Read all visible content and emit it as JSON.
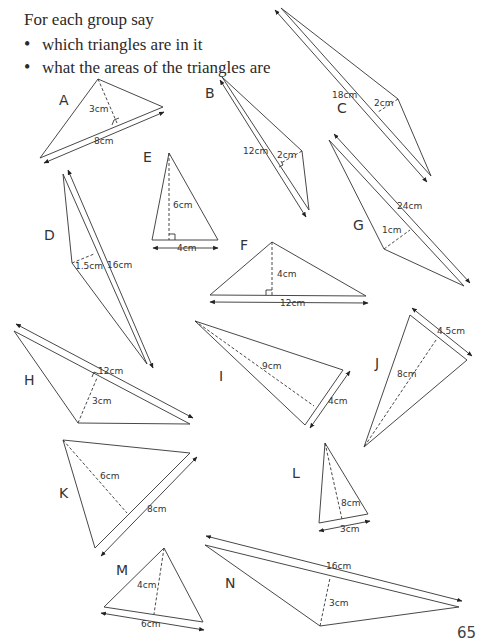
{
  "instructions": {
    "title": "For each group say",
    "bullets": [
      "which triangles are in it",
      "what the areas of the triangles are"
    ]
  },
  "triangles": [
    {
      "label": "A",
      "base": "8cm",
      "height": "3cm"
    },
    {
      "label": "B",
      "base": "12cm",
      "height": "2cm"
    },
    {
      "label": "C",
      "base": "18cm",
      "height": "2cm"
    },
    {
      "label": "D",
      "base": "16cm",
      "height": "1.5cm"
    },
    {
      "label": "E",
      "base": "4cm",
      "height": "6cm"
    },
    {
      "label": "F",
      "base": "12cm",
      "height": "4cm"
    },
    {
      "label": "G",
      "base": "24cm",
      "height": "1cm"
    },
    {
      "label": "H",
      "base": "12cm",
      "height": "3cm"
    },
    {
      "label": "I",
      "base": "4cm",
      "height": "9cm"
    },
    {
      "label": "J",
      "base": "4.5cm",
      "height": "8cm"
    },
    {
      "label": "K",
      "base": "8cm",
      "height": "6cm"
    },
    {
      "label": "L",
      "base": "3cm",
      "height": "8cm"
    },
    {
      "label": "M",
      "base": "6cm",
      "height": "4cm"
    },
    {
      "label": "N",
      "base": "16cm",
      "height": "3cm"
    }
  ],
  "page_number": "65"
}
